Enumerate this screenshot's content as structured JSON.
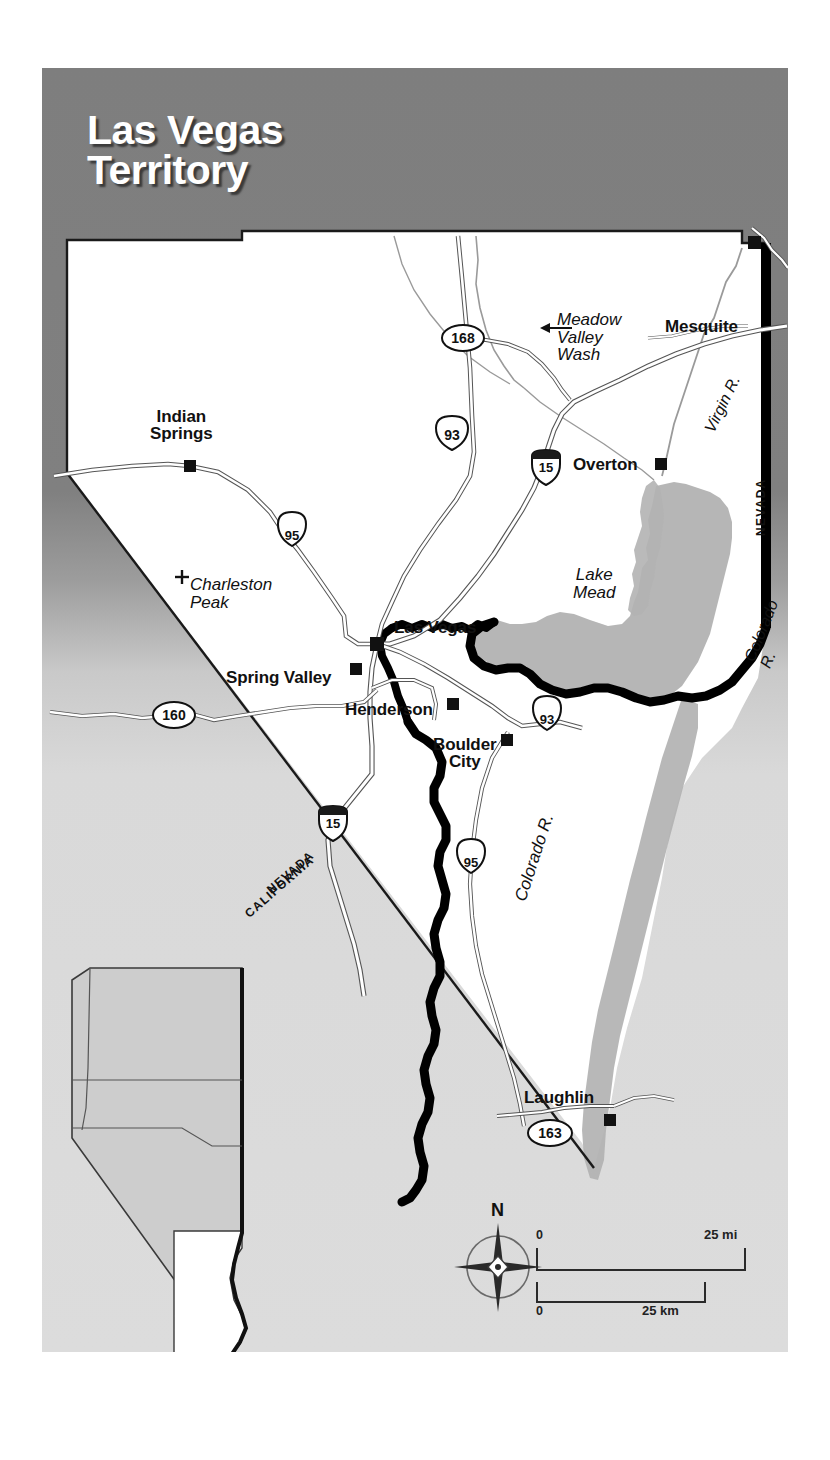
{
  "map": {
    "title": "Las Vegas\nTerritory",
    "cities": [
      {
        "name": "Indian Springs",
        "label": "Indian\nSprings",
        "x": 148,
        "y": 398,
        "lx": 108,
        "ly": 340,
        "align": "center"
      },
      {
        "name": "Las Vegas",
        "label": "Las Vegas",
        "x": 335,
        "y": 576,
        "lx": 352,
        "ly": 552,
        "align": "left"
      },
      {
        "name": "Spring Valley",
        "label": "Spring Valley",
        "x": 314,
        "y": 601,
        "lx": 184,
        "ly": 608,
        "align": "left"
      },
      {
        "name": "Henderson",
        "label": "Henderson",
        "x": 411,
        "y": 636,
        "lx": 303,
        "ly": 641,
        "align": "left"
      },
      {
        "name": "Boulder City",
        "label": "Boulder\nCity",
        "x": 465,
        "y": 672,
        "lx": 391,
        "ly": 676,
        "align": "left"
      },
      {
        "name": "Overton",
        "label": "Overton",
        "x": 619,
        "y": 396,
        "lx": 531,
        "ly": 396,
        "align": "left"
      },
      {
        "name": "Mesquite",
        "label": "Mesquite",
        "x": 745,
        "y": 258,
        "lx": 623,
        "ly": 256,
        "align": "left"
      },
      {
        "name": "Laughlin",
        "label": "Laughlin",
        "x": 568,
        "y": 1052,
        "lx": 482,
        "ly": 1029,
        "align": "left"
      }
    ],
    "peaks": [
      {
        "name": "Charleston Peak",
        "label": "Charleston\nPeak",
        "x": 139,
        "y": 509,
        "lx": 148,
        "ly": 516
      }
    ],
    "water_labels": [
      {
        "name": "lake-mead",
        "label": "Lake\nMead",
        "x": 560,
        "y": 508
      },
      {
        "name": "colorado-river-east",
        "label": "Colorado R.",
        "x": 713,
        "y": 517
      },
      {
        "name": "colorado-river-south",
        "label": "Colorado R.",
        "x": 487,
        "y": 757
      },
      {
        "name": "virgin-river",
        "label": "Virgin R.",
        "x": 672,
        "y": 306
      },
      {
        "name": "meadow-valley-wash",
        "label": "Meadow\nValley\nWash",
        "x": 544,
        "y": 253
      }
    ],
    "state_labels": [
      {
        "name": "nevada-east",
        "label": "NEVADA",
        "x": 741,
        "y": 430
      },
      {
        "name": "arizona-east",
        "label": "ARIZONA",
        "x": 775,
        "y": 430
      },
      {
        "name": "nevada-south",
        "label": "NEVADA",
        "x": 272,
        "y": 866
      },
      {
        "name": "california-south",
        "label": "CALIFORNIA",
        "x": 250,
        "y": 891
      }
    ],
    "highway_shields": [
      {
        "name": "shield-168",
        "number": "168",
        "type": "state",
        "x": 471,
        "y": 276
      },
      {
        "name": "shield-93-north",
        "number": "93",
        "type": "us",
        "x": 430,
        "y": 366
      },
      {
        "name": "shield-15-north",
        "number": "15",
        "type": "interstate",
        "x": 504,
        "y": 399
      },
      {
        "name": "shield-95-north",
        "number": "95",
        "type": "us",
        "x": 250,
        "y": 468
      },
      {
        "name": "shield-160",
        "number": "160",
        "type": "state",
        "x": 132,
        "y": 647
      },
      {
        "name": "shield-93-boulder",
        "number": "93",
        "type": "us",
        "x": 505,
        "y": 652
      },
      {
        "name": "shield-15-south",
        "number": "15",
        "type": "interstate",
        "x": 291,
        "y": 755
      },
      {
        "name": "shield-95-south",
        "number": "95",
        "type": "us",
        "x": 429,
        "y": 795
      },
      {
        "name": "shield-163",
        "number": "163",
        "type": "state",
        "x": 508,
        "y": 1065
      }
    ],
    "compass": {
      "north_letter": "N"
    },
    "scale_bar": {
      "miles": {
        "zero": "0",
        "value": "25 mi"
      },
      "kilometers": {
        "zero": "0",
        "value": "25 km"
      }
    },
    "inset": {
      "name": "nevada-state-inset"
    },
    "colors": {
      "header_gray": "#808080",
      "lower_gray": "#d9d9d9",
      "land_white": "#ffffff",
      "water_gray": "#b0b0b0",
      "boundary_black": "#000000"
    }
  }
}
